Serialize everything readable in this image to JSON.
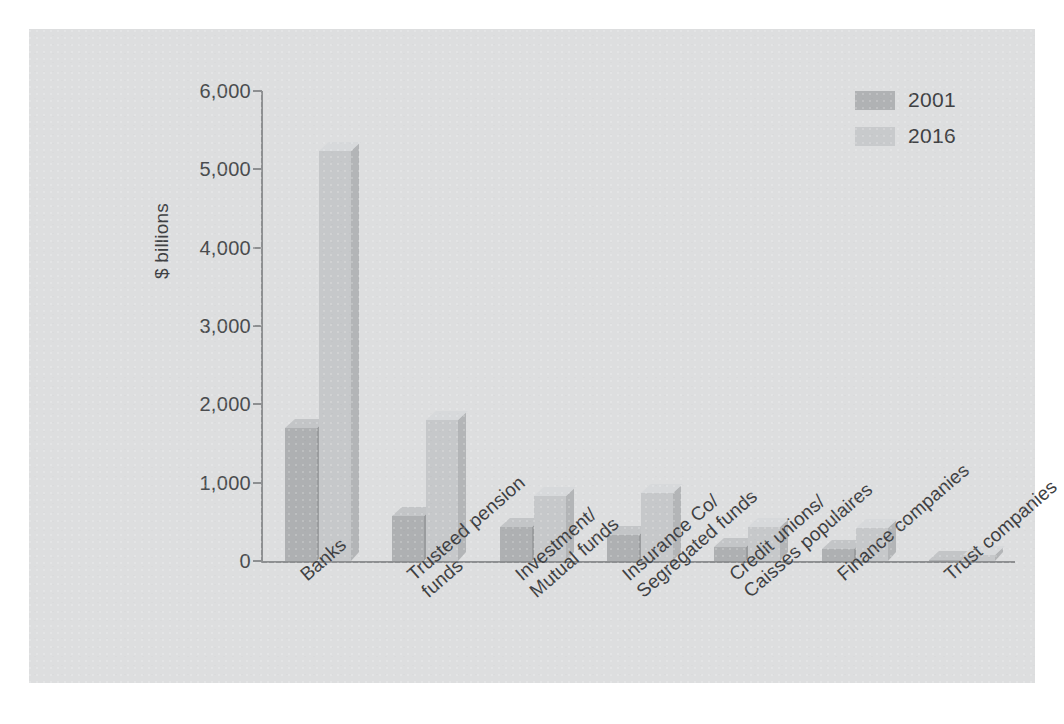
{
  "chart_data": {
    "type": "bar",
    "title": "",
    "subtitle": "",
    "xlabel": "",
    "ylabel": "$ billions",
    "ylim": [
      0,
      6000
    ],
    "ytick_labels": [
      "6,000",
      "5,000",
      "4,000",
      "3,000",
      "2,000",
      "1,000",
      "0"
    ],
    "ytick_values": [
      6000,
      5000,
      4000,
      3000,
      2000,
      1000,
      0
    ],
    "grid": false,
    "legend_position": "top-right",
    "categories": [
      "Banks",
      "Trusteed pension funds",
      "Investment/Mutual funds",
      "Insurance Co/Segregated funds",
      "Credit unions/Caisses populaires",
      "Finance companies",
      "Trust companies"
    ],
    "category_lines": [
      [
        "Banks"
      ],
      [
        "Trusteed pension",
        "funds"
      ],
      [
        "Investment/",
        "Mutual funds"
      ],
      [
        "Insurance Co/",
        "Segregated funds"
      ],
      [
        "Credit unions/",
        "Caisses populaires"
      ],
      [
        "Finance companies"
      ],
      [
        "Trust companies"
      ]
    ],
    "series": [
      {
        "name": "2001",
        "color": "#aeb0b2",
        "values": [
          1700,
          580,
          440,
          330,
          180,
          150,
          15
        ]
      },
      {
        "name": "2016",
        "color": "#c6c8ca",
        "values": [
          5230,
          1800,
          830,
          870,
          440,
          420,
          80
        ]
      }
    ]
  },
  "legend": {
    "items": [
      {
        "label": "2001"
      },
      {
        "label": "2016"
      }
    ]
  },
  "colors": {
    "panel_background": "#dddedf",
    "page_background": "#ffffff",
    "axis": "#8d8f91",
    "text": "#3f4143",
    "series_2001": "#aeb0b2",
    "series_2016": "#c6c8ca"
  }
}
